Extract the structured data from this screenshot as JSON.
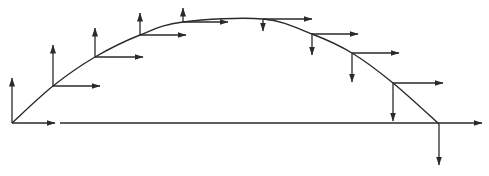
{
  "diagram": {
    "title": "",
    "colors": {
      "stroke": "#2a2a2a",
      "background": "#ffffff"
    },
    "baseline": {
      "x1": 60,
      "y1": 123,
      "x2": 482,
      "y2": 123
    },
    "origin_gap_arrow": {
      "x1": 12,
      "y1": 123,
      "x2": 55,
      "y2": 123
    },
    "trajectory_points": [
      {
        "x": 12,
        "y": 123,
        "vx_end": 55,
        "vy_end": 78
      },
      {
        "x": 53,
        "y": 86,
        "vx_end": 100,
        "vy_end": 45
      },
      {
        "x": 95,
        "y": 57,
        "vx_end": 143,
        "vy_end": 28
      },
      {
        "x": 140,
        "y": 35,
        "vx_end": 186,
        "vy_end": 13
      },
      {
        "x": 183,
        "y": 22,
        "vx_end": 228,
        "vy_end": 8
      },
      {
        "x": 263,
        "y": 19,
        "vx_end": 312,
        "vy_end": 31
      },
      {
        "x": 312,
        "y": 34,
        "vx_end": 358,
        "vy_end": 55
      },
      {
        "x": 352,
        "y": 53,
        "vx_end": 399,
        "vy_end": 82
      },
      {
        "x": 393,
        "y": 83,
        "vx_end": 443,
        "vy_end": 121
      },
      {
        "x": 439,
        "y": 124,
        "vx_end": null,
        "vy_end": 165
      }
    ]
  }
}
